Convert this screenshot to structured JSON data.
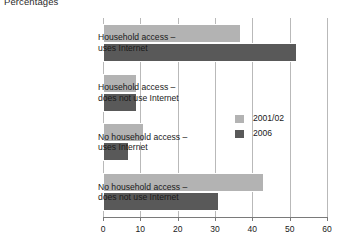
{
  "chart_data": {
    "type": "bar",
    "orientation": "horizontal",
    "title": "Percentages",
    "xlabel": "",
    "ylabel": "",
    "xlim": [
      0,
      60
    ],
    "xticks": [
      0,
      10,
      20,
      30,
      40,
      50,
      60
    ],
    "grid": true,
    "legend_position": "center-right",
    "categories": [
      "Household access – uses Internet",
      "Household access – does not use Internet",
      "No household access – uses Internet",
      "No household access – does not use Internet"
    ],
    "category_lines": [
      [
        "Household access  –",
        "uses Internet"
      ],
      [
        "Household access –",
        "does not use Internet"
      ],
      [
        "No household access –",
        "uses Internet"
      ],
      [
        "No household access  –",
        "does not use Internet"
      ]
    ],
    "series": [
      {
        "name": "2001/02",
        "color": "#b3b3b3",
        "values": [
          37,
          9,
          11,
          43
        ]
      },
      {
        "name": "2006",
        "color": "#595959",
        "values": [
          52,
          9,
          7,
          31
        ]
      }
    ]
  }
}
